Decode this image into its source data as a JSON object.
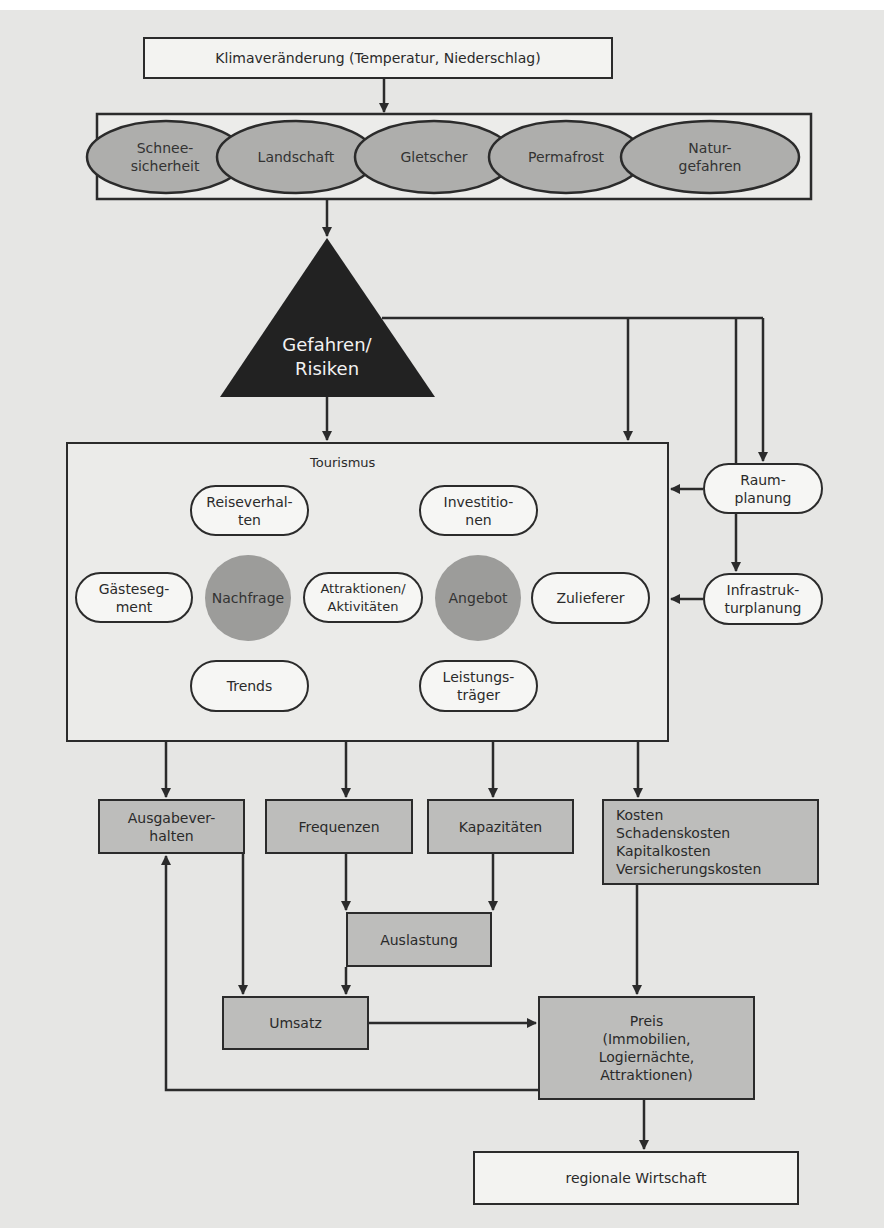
{
  "title_box": {
    "label": "Klimaveränderung (Temperatur, Niederschlag)"
  },
  "impacts": [
    {
      "label": "Schnee-\nsicherheit"
    },
    {
      "label": "Landschaft"
    },
    {
      "label": "Gletscher"
    },
    {
      "label": "Permafrost"
    },
    {
      "label": "Natur-\ngefahren"
    }
  ],
  "hazard": {
    "label": "Gefahren/\nRisiken"
  },
  "tourism": {
    "title": "Tourismus",
    "demand_center": "Nachfrage",
    "supply_center": "Angebot",
    "nodes": {
      "reiseverhalten": "Reiseverhal-\nten",
      "gaestesegment": "Gästeseg-\nment",
      "trends": "Trends",
      "attraktionen": "Attraktionen/\nAktivitäten",
      "investitionen": "Investitio-\nnen",
      "zulieferer": "Zulieferer",
      "leistungstraeger": "Leistungs-\nträger"
    }
  },
  "planning": {
    "raumplanung": "Raum-\nplanung",
    "infrastrukturplanung": "Infrastruk-\nturplanung"
  },
  "outputs": {
    "ausgabeverhalten": "Ausgabever-\nhalten",
    "frequenzen": "Frequenzen",
    "kapazitaeten": "Kapazitäten",
    "kosten": "Kosten\nSchadenskosten\nKapitalkosten\nVersicherungskosten",
    "auslastung": "Auslastung",
    "umsatz": "Umsatz",
    "preis": "Preis\n(Immobilien,\nLogiernächte,\nAttraktionen)",
    "regionale_wirtschaft": "regionale Wirtschaft"
  },
  "colors": {
    "background": "#e6e6e4",
    "line": "#2b2b2b",
    "gray_box": "#bdbdbb",
    "ellipse_fill": "#aeaeac",
    "circle_fill": "#9c9c9a",
    "triangle_fill": "#222222"
  }
}
